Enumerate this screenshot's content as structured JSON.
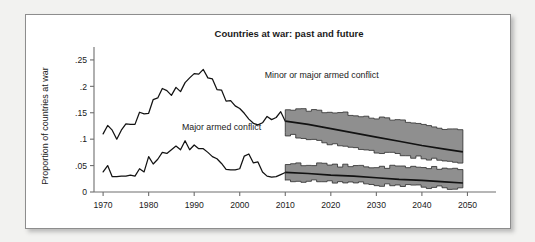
{
  "figure": {
    "title": "Countries at war: past and future",
    "border_color": "#8d8d8d",
    "background_color": "#ffffff",
    "page_background": "#f2f2f0"
  },
  "chart_data": {
    "type": "line",
    "title": "Countries at war: past and future",
    "xlabel": "",
    "ylabel": "Proportion of countries at war",
    "xlim": [
      1968,
      2051
    ],
    "ylim": [
      0,
      0.265
    ],
    "grid": false,
    "legend_position": "inline-annotations",
    "xticks": [
      1970,
      1980,
      1990,
      2000,
      2010,
      2020,
      2030,
      2040,
      2050
    ],
    "xtick_labels": [
      "1970",
      "1980",
      "1990",
      "2000",
      "2010",
      "2020",
      "2030",
      "2040",
      "2050"
    ],
    "yticks": [
      0,
      0.05,
      0.1,
      0.15,
      0.2,
      0.25
    ],
    "ytick_labels": [
      "0",
      ".05",
      ".1",
      ".15",
      ".2",
      ".25"
    ],
    "annotations": [
      {
        "text": "Minor or major armed conflict",
        "x": 2018,
        "y": 0.215
      },
      {
        "text": "Major armed conflict",
        "x": 1996,
        "y": 0.118
      }
    ],
    "colors": {
      "line": "#121212",
      "confidence_band_fill": "#8f8f8f",
      "confidence_band_stroke": "#2b2b2b",
      "axis": "#6e6e6e"
    },
    "series": [
      {
        "name": "Minor or major armed conflict",
        "kind": "historical",
        "x": [
          1970,
          1971,
          1972,
          1973,
          1974,
          1975,
          1976,
          1977,
          1978,
          1979,
          1980,
          1981,
          1982,
          1983,
          1984,
          1985,
          1986,
          1987,
          1988,
          1989,
          1990,
          1991,
          1992,
          1993,
          1994,
          1995,
          1996,
          1997,
          1998,
          1999,
          2000,
          2001,
          2002,
          2003,
          2004,
          2005,
          2006,
          2007,
          2008,
          2009,
          2010
        ],
        "y": [
          0.11,
          0.126,
          0.117,
          0.1,
          0.117,
          0.129,
          0.128,
          0.128,
          0.151,
          0.148,
          0.149,
          0.175,
          0.178,
          0.196,
          0.192,
          0.183,
          0.198,
          0.19,
          0.207,
          0.216,
          0.224,
          0.223,
          0.232,
          0.216,
          0.214,
          0.194,
          0.193,
          0.172,
          0.173,
          0.163,
          0.158,
          0.149,
          0.138,
          0.13,
          0.127,
          0.131,
          0.143,
          0.137,
          0.141,
          0.152,
          0.134
        ]
      },
      {
        "name": "Major armed conflict",
        "kind": "historical",
        "x": [
          1970,
          1971,
          1972,
          1973,
          1974,
          1975,
          1976,
          1977,
          1978,
          1979,
          1980,
          1981,
          1982,
          1983,
          1984,
          1985,
          1986,
          1987,
          1988,
          1989,
          1990,
          1991,
          1992,
          1993,
          1994,
          1995,
          1996,
          1997,
          1998,
          1999,
          2000,
          2001,
          2002,
          2003,
          2004,
          2005,
          2006,
          2007,
          2008,
          2009,
          2010
        ],
        "y": [
          0.038,
          0.05,
          0.029,
          0.029,
          0.03,
          0.03,
          0.032,
          0.03,
          0.044,
          0.038,
          0.067,
          0.053,
          0.062,
          0.075,
          0.073,
          0.08,
          0.087,
          0.08,
          0.097,
          0.08,
          0.089,
          0.082,
          0.082,
          0.075,
          0.067,
          0.063,
          0.054,
          0.043,
          0.042,
          0.042,
          0.044,
          0.068,
          0.072,
          0.055,
          0.057,
          0.038,
          0.03,
          0.028,
          0.029,
          0.033,
          0.037
        ]
      },
      {
        "name": "Minor or major armed conflict (projection)",
        "kind": "projection",
        "x": [
          2010,
          2015,
          2020,
          2025,
          2030,
          2035,
          2040,
          2045,
          2049
        ],
        "y": [
          0.134,
          0.128,
          0.12,
          0.112,
          0.104,
          0.096,
          0.088,
          0.081,
          0.076
        ],
        "ci_upper": [
          0.156,
          0.155,
          0.151,
          0.146,
          0.14,
          0.134,
          0.127,
          0.119,
          0.113
        ],
        "ci_lower": [
          0.111,
          0.1,
          0.091,
          0.084,
          0.077,
          0.071,
          0.065,
          0.059,
          0.053
        ]
      },
      {
        "name": "Major armed conflict (projection)",
        "kind": "projection",
        "x": [
          2010,
          2015,
          2020,
          2025,
          2030,
          2035,
          2040,
          2045,
          2049
        ],
        "y": [
          0.037,
          0.035,
          0.032,
          0.03,
          0.027,
          0.024,
          0.022,
          0.019,
          0.017
        ],
        "ci_upper": [
          0.051,
          0.053,
          0.05,
          0.049,
          0.047,
          0.048,
          0.046,
          0.044,
          0.043
        ],
        "ci_lower": [
          0.021,
          0.021,
          0.02,
          0.018,
          0.014,
          0.012,
          0.01,
          0.008,
          0.006
        ]
      }
    ]
  }
}
